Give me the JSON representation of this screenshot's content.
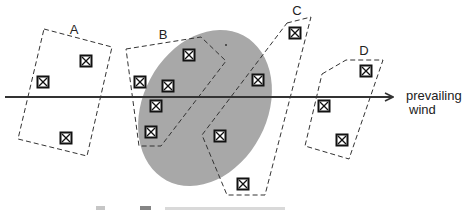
{
  "diagram": {
    "wind_label_line1": "prevailing",
    "wind_label_line2": "wind",
    "zones": [
      {
        "label": "A"
      },
      {
        "label": "B"
      },
      {
        "label": "C"
      },
      {
        "label": "D"
      }
    ],
    "plume_color": "#aaaaaa",
    "marker_icon": "boxed-x-marker-icon",
    "marker_count": 16,
    "caption_partial": "Key: ⊠ ..."
  }
}
